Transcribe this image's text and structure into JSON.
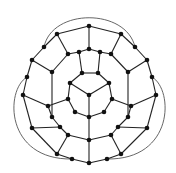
{
  "diagram": {
    "type": "planar-graph",
    "colors": {
      "edge": "#222222",
      "node": "#111111",
      "arc": "#555555",
      "background": "#ffffff"
    },
    "nodes": [
      [
        89,
        26
      ],
      [
        57,
        34
      ],
      [
        121,
        34
      ],
      [
        44,
        47
      ],
      [
        135,
        47
      ],
      [
        32,
        60
      ],
      [
        147,
        60
      ],
      [
        27,
        77
      ],
      [
        152,
        77
      ],
      [
        23,
        95
      ],
      [
        156,
        95
      ],
      [
        32,
        128
      ],
      [
        147,
        128
      ],
      [
        57,
        154
      ],
      [
        121,
        154
      ],
      [
        72,
        159
      ],
      [
        107,
        159
      ],
      [
        89,
        163
      ],
      [
        68,
        54
      ],
      [
        79,
        52
      ],
      [
        89,
        49
      ],
      [
        100,
        52
      ],
      [
        111,
        54
      ],
      [
        52,
        72
      ],
      [
        128,
        72
      ],
      [
        48,
        106
      ],
      [
        131,
        106
      ],
      [
        52,
        117
      ],
      [
        128,
        117
      ],
      [
        60,
        127
      ],
      [
        118,
        127
      ],
      [
        68,
        135
      ],
      [
        111,
        135
      ],
      [
        89,
        140
      ],
      [
        82,
        73
      ],
      [
        98,
        73
      ],
      [
        68,
        99
      ],
      [
        112,
        99
      ],
      [
        75,
        112
      ],
      [
        104,
        112
      ],
      [
        70,
        83
      ],
      [
        109,
        83
      ],
      [
        89,
        95
      ],
      [
        89,
        117
      ]
    ],
    "edges": [
      [
        0,
        1
      ],
      [
        0,
        2
      ],
      [
        1,
        3
      ],
      [
        2,
        4
      ],
      [
        3,
        5
      ],
      [
        4,
        6
      ],
      [
        5,
        7
      ],
      [
        6,
        8
      ],
      [
        7,
        9
      ],
      [
        8,
        10
      ],
      [
        9,
        11
      ],
      [
        10,
        12
      ],
      [
        11,
        13
      ],
      [
        12,
        14
      ],
      [
        13,
        15
      ],
      [
        14,
        16
      ],
      [
        15,
        17
      ],
      [
        16,
        17
      ],
      [
        0,
        20
      ],
      [
        1,
        18
      ],
      [
        2,
        22
      ],
      [
        5,
        23
      ],
      [
        6,
        24
      ],
      [
        9,
        25
      ],
      [
        10,
        26
      ],
      [
        11,
        29
      ],
      [
        12,
        30
      ],
      [
        13,
        31
      ],
      [
        14,
        32
      ],
      [
        17,
        33
      ],
      [
        18,
        19
      ],
      [
        19,
        20
      ],
      [
        20,
        21
      ],
      [
        21,
        22
      ],
      [
        18,
        23
      ],
      [
        22,
        24
      ],
      [
        23,
        27
      ],
      [
        24,
        28
      ],
      [
        27,
        29
      ],
      [
        28,
        30
      ],
      [
        29,
        31
      ],
      [
        30,
        32
      ],
      [
        31,
        33
      ],
      [
        32,
        33
      ],
      [
        25,
        27
      ],
      [
        26,
        28
      ],
      [
        19,
        34
      ],
      [
        21,
        35
      ],
      [
        34,
        35
      ],
      [
        25,
        36
      ],
      [
        26,
        37
      ],
      [
        36,
        38
      ],
      [
        37,
        39
      ],
      [
        38,
        43
      ],
      [
        39,
        43
      ],
      [
        34,
        40
      ],
      [
        35,
        41
      ],
      [
        40,
        36
      ],
      [
        41,
        37
      ],
      [
        40,
        42
      ],
      [
        41,
        42
      ],
      [
        42,
        43
      ],
      [
        33,
        43
      ]
    ],
    "arcs": [
      {
        "from": 3,
        "to": 4,
        "path": "M44,47 C52,8 126,8 135,47"
      },
      {
        "from": 7,
        "to": 15,
        "path": "M27,77 C5,90 5,160 72,159"
      },
      {
        "from": 8,
        "to": 16,
        "path": "M152,77 C174,90 174,160 107,159"
      }
    ]
  }
}
